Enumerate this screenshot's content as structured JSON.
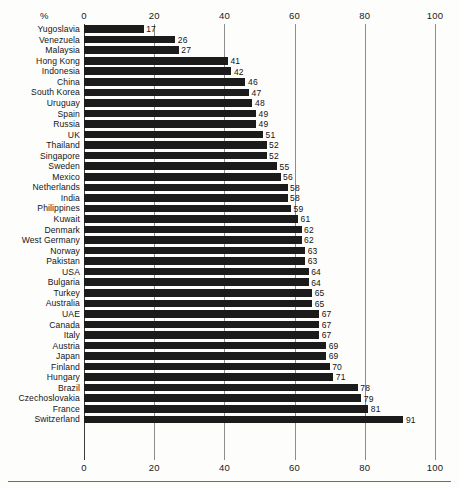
{
  "chart_data": {
    "type": "bar",
    "orientation": "horizontal",
    "title": "",
    "subtitle": "",
    "unit_label": "%",
    "xlabel": "",
    "ylabel": "",
    "xlim": [
      0,
      100
    ],
    "xticks": [
      0,
      20,
      40,
      60,
      80,
      100
    ],
    "xtick_labels": [
      "0",
      "20",
      "40",
      "60",
      "80",
      "100"
    ],
    "grid": true,
    "grid_axis": "x",
    "legend": false,
    "axis_top": true,
    "axis_bottom": true,
    "value_labels": true,
    "bar_color": "#1b1b1b",
    "grid_color": "#8e8e8e",
    "background_color": "#fdfdfc",
    "categories": [
      "Yugoslavia",
      "Venezuela",
      "Malaysia",
      "Hong Kong",
      "Indonesia",
      "China",
      "South Korea",
      "Uruguay",
      "Spain",
      "Russia",
      "UK",
      "Thailand",
      "Singapore",
      "Sweden",
      "Mexico",
      "Netherlands",
      "India",
      "Philippines",
      "Kuwait",
      "Denmark",
      "West Germany",
      "Norway",
      "Pakistan",
      "USA",
      "Bulgaria",
      "Turkey",
      "Australia",
      "UAE",
      "Canada",
      "Italy",
      "Austria",
      "Japan",
      "Finland",
      "Hungary",
      "Brazil",
      "Czechoslovakia",
      "France",
      "Switzerland"
    ],
    "values": [
      17,
      26,
      27,
      41,
      42,
      46,
      47,
      48,
      49,
      49,
      51,
      52,
      52,
      55,
      56,
      58,
      58,
      59,
      61,
      62,
      62,
      63,
      63,
      64,
      64,
      65,
      65,
      67,
      67,
      67,
      69,
      69,
      70,
      71,
      78,
      79,
      81,
      91
    ]
  }
}
